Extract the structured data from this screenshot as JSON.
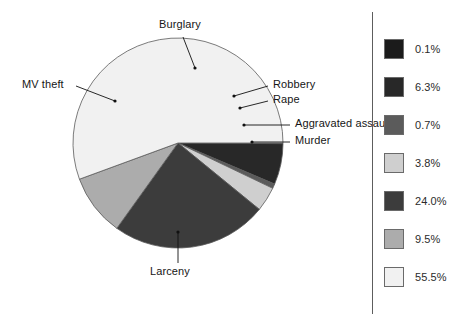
{
  "chart_data": {
    "type": "pie",
    "title": "",
    "subtitle": "",
    "xlabel": "",
    "ylabel": "",
    "legend_position": "right",
    "grid": false,
    "categories": [
      "Murder",
      "Aggravated assault",
      "Rape",
      "Robbery",
      "Burglary",
      "MV theft",
      "Larceny"
    ],
    "values": [
      0.1,
      6.3,
      0.7,
      3.8,
      24.0,
      9.5,
      55.5
    ],
    "value_labels": [
      "0.1%",
      "6.3%",
      "0.7%",
      "3.8%",
      "24.0%",
      "9.5%",
      "55.5%"
    ],
    "colors": [
      "#1b1b1b",
      "#282828",
      "#5b5b5b",
      "#cfcfcf",
      "#3c3c3c",
      "#acacac",
      "#f1f1f1"
    ],
    "slices": [
      {
        "name": "Murder",
        "value": 0.1,
        "label": "0.1%",
        "color": "#1b1b1b",
        "start_deg": 0.0,
        "end_deg": 0.36
      },
      {
        "name": "Aggravated assault",
        "value": 6.3,
        "label": "6.3%",
        "color": "#282828",
        "start_deg": 0.36,
        "end_deg": 23.04
      },
      {
        "name": "Rape",
        "value": 0.7,
        "label": "0.7%",
        "color": "#5b5b5b",
        "start_deg": 23.04,
        "end_deg": 25.56
      },
      {
        "name": "Robbery",
        "value": 3.8,
        "label": "3.8%",
        "color": "#cfcfcf",
        "start_deg": 25.56,
        "end_deg": 39.24
      },
      {
        "name": "Burglary",
        "value": 24.0,
        "label": "24.0%",
        "color": "#3c3c3c",
        "start_deg": 39.24,
        "end_deg": 125.64
      },
      {
        "name": "MV theft",
        "value": 9.5,
        "label": "9.5%",
        "color": "#acacac",
        "start_deg": 125.64,
        "end_deg": 159.84
      },
      {
        "name": "Larceny",
        "value": 55.5,
        "label": "55.5%",
        "color": "#f1f1f1",
        "start_deg": 159.84,
        "end_deg": 360.0
      }
    ]
  },
  "pie_labels": {
    "burglary": "Burglary",
    "mv_theft": "MV theft",
    "robbery": "Robbery",
    "rape": "Rape",
    "aggravated_assault": "Aggravated assault",
    "murder": "Murder",
    "larceny": "Larceny"
  },
  "legend": {
    "entries": [
      {
        "label": "0.1%",
        "color": "#1b1b1b"
      },
      {
        "label": "6.3%",
        "color": "#282828"
      },
      {
        "label": "0.7%",
        "color": "#5b5b5b"
      },
      {
        "label": "3.8%",
        "color": "#cfcfcf"
      },
      {
        "label": "24.0%",
        "color": "#3c3c3c"
      },
      {
        "label": "9.5%",
        "color": "#acacac"
      },
      {
        "label": "55.5%",
        "color": "#f1f1f1"
      }
    ]
  }
}
